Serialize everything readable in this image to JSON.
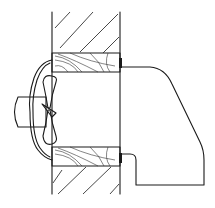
{
  "figure": {
    "colors": {
      "line": "#1a1a1a",
      "background": "#ffffff"
    },
    "components": [
      {
        "id": "wall",
        "label": "masonry wall (hatched)"
      },
      {
        "id": "sleeve-top",
        "label": "wood sleeve upper"
      },
      {
        "id": "sleeve-bottom",
        "label": "wood sleeve lower"
      },
      {
        "id": "fan-blade",
        "label": "fan blade"
      },
      {
        "id": "motor",
        "label": "motor"
      },
      {
        "id": "grille",
        "label": "inner grille / shroud"
      },
      {
        "id": "hood",
        "label": "exterior weather hood"
      }
    ]
  }
}
